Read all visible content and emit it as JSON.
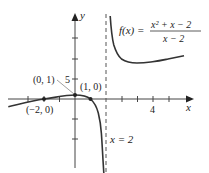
{
  "figure": {
    "function_label": "f(x) =",
    "numerator": "x² + x − 2",
    "denominator": "x − 2",
    "asymptote_label": "x = 2",
    "x_axis_label": "x",
    "y_axis_label": "y",
    "x_tick_label": "4",
    "y_tick_label": "5",
    "points": [
      {
        "label": "(0, 1)"
      },
      {
        "label": "(1, 0)"
      },
      {
        "label": "(−2, 0)"
      }
    ],
    "colors": {
      "curve": "#333333",
      "axis": "#444444",
      "text": "#222222"
    }
  }
}
